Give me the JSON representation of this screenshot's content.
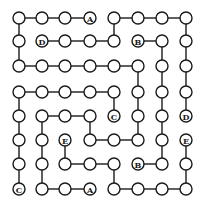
{
  "puzzle": {
    "type": "connect-matching-letters-grid",
    "cols_x": [
      19,
      42,
      65,
      90,
      114,
      138,
      162,
      186
    ],
    "rows_y": [
      18,
      41,
      66,
      92,
      116,
      140,
      164,
      189
    ],
    "node_radius": 6,
    "colors": {
      "background": "#ffffff",
      "line": "#1a1a1a",
      "node_fill": "#ffffff"
    },
    "labels": [
      {
        "r": 0,
        "c": 3,
        "text": "A"
      },
      {
        "r": 1,
        "c": 1,
        "text": "D"
      },
      {
        "r": 1,
        "c": 5,
        "text": "B"
      },
      {
        "r": 4,
        "c": 4,
        "text": "C"
      },
      {
        "r": 4,
        "c": 7,
        "text": "D"
      },
      {
        "r": 5,
        "c": 2,
        "text": "E"
      },
      {
        "r": 5,
        "c": 7,
        "text": "E"
      },
      {
        "r": 6,
        "c": 5,
        "text": "B"
      },
      {
        "r": 7,
        "c": 0,
        "text": "C"
      },
      {
        "r": 7,
        "c": 3,
        "text": "A"
      }
    ],
    "h_edges": [
      [
        0,
        0
      ],
      [
        0,
        1
      ],
      [
        0,
        2
      ],
      [
        0,
        4
      ],
      [
        0,
        5
      ],
      [
        0,
        6
      ],
      [
        1,
        1
      ],
      [
        1,
        2
      ],
      [
        1,
        3
      ],
      [
        1,
        5
      ],
      [
        2,
        0
      ],
      [
        2,
        1
      ],
      [
        2,
        2
      ],
      [
        2,
        3
      ],
      [
        2,
        4
      ],
      [
        3,
        0
      ],
      [
        3,
        1
      ],
      [
        3,
        2
      ],
      [
        3,
        3
      ],
      [
        4,
        1
      ],
      [
        4,
        2
      ],
      [
        5,
        3
      ],
      [
        5,
        4
      ],
      [
        6,
        2
      ],
      [
        6,
        3
      ],
      [
        6,
        5
      ],
      [
        7,
        1
      ],
      [
        7,
        2
      ],
      [
        7,
        4
      ],
      [
        7,
        5
      ],
      [
        7,
        6
      ]
    ],
    "v_edges": [
      [
        0,
        0
      ],
      [
        1,
        0
      ],
      [
        3,
        0
      ],
      [
        4,
        0
      ],
      [
        5,
        0
      ],
      [
        6,
        0
      ],
      [
        4,
        1
      ],
      [
        5,
        1
      ],
      [
        6,
        1
      ],
      [
        5,
        2
      ],
      [
        4,
        3
      ],
      [
        0,
        4
      ],
      [
        3,
        4
      ],
      [
        6,
        4
      ],
      [
        2,
        5
      ],
      [
        3,
        5
      ],
      [
        4,
        5
      ],
      [
        1,
        6
      ],
      [
        2,
        6
      ],
      [
        3,
        6
      ],
      [
        4,
        6
      ],
      [
        5,
        6
      ],
      [
        0,
        7
      ],
      [
        1,
        7
      ],
      [
        2,
        7
      ],
      [
        3,
        7
      ],
      [
        5,
        7
      ],
      [
        6,
        7
      ]
    ]
  }
}
